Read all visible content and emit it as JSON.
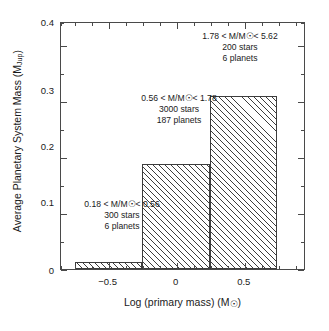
{
  "chart_data": {
    "type": "bar",
    "title": "",
    "xlabel": "Log (primary mass) (M☉)",
    "ylabel": "Average Planetary System Mass (M_Jup)",
    "ylabel_main": "Average Planetary System Mass (M",
    "ylabel_sub": "Jup",
    "ylabel_tail": ")",
    "xlabel_main": "Log (primary mass) (M",
    "xlabel_sun": "☉",
    "xlabel_tail": ")",
    "xlim": [
      -0.85,
      0.95
    ],
    "ylim": [
      0,
      0.44
    ],
    "grid": false,
    "legend": "none",
    "categories": [
      "0.18 < M/M☉ < 0.56",
      "0.56 < M/M☉ < 1.78",
      "1.78 < M/M☉ < 5.62"
    ],
    "bin_edges": [
      -0.75,
      -0.25,
      0.25,
      0.75
    ],
    "values": [
      0.013,
      0.188,
      0.31
    ],
    "bars": [
      {
        "x0": -0.75,
        "x1": -0.25,
        "value": 0.013
      },
      {
        "x0": -0.25,
        "x1": 0.25,
        "value": 0.188
      },
      {
        "x0": 0.25,
        "x1": 0.75,
        "value": 0.31
      }
    ],
    "xticks_major": [
      -0.5,
      0,
      0.5
    ],
    "xtick_labels": [
      "−0.5",
      "0",
      "0.5"
    ],
    "xticks_minor": [
      -0.75,
      -0.625,
      -0.375,
      -0.25,
      -0.125,
      0.125,
      0.25,
      0.375,
      0.625,
      0.75,
      0.875,
      -0.875
    ],
    "yticks_major": [
      0,
      0.1,
      0.2,
      0.3,
      0.4
    ],
    "ytick_labels": [
      "0",
      "0.1",
      "0.2",
      "0.3",
      "0.4"
    ],
    "yticks_minor": [
      0.05,
      0.15,
      0.25,
      0.35
    ],
    "annotations": [
      {
        "id": "bin-high-mass",
        "lines": [
          "1.78 < M/M☉< 5.62",
          "200 stars",
          "6 planets"
        ],
        "range_low": 1.78,
        "range_high": 5.62,
        "stars": 200,
        "planets": 6
      },
      {
        "id": "bin-solar-mass",
        "lines": [
          "0.56 < M/M☉< 1.78",
          "3000 stars",
          "187 planets"
        ],
        "range_low": 0.56,
        "range_high": 1.78,
        "stars": 3000,
        "planets": 187
      },
      {
        "id": "bin-low-mass",
        "lines": [
          "0.18 < M/M☉< 0.56",
          "300 stars",
          "6 planets"
        ],
        "range_low": 0.18,
        "range_high": 0.56,
        "stars": 300,
        "planets": 6
      }
    ],
    "colors": {
      "axis": "#4a4a4a",
      "bar_edge": "#3d3d3d",
      "hatch": "#3d3d3d",
      "background": "#ffffff",
      "text": "#1a1a1a"
    }
  }
}
